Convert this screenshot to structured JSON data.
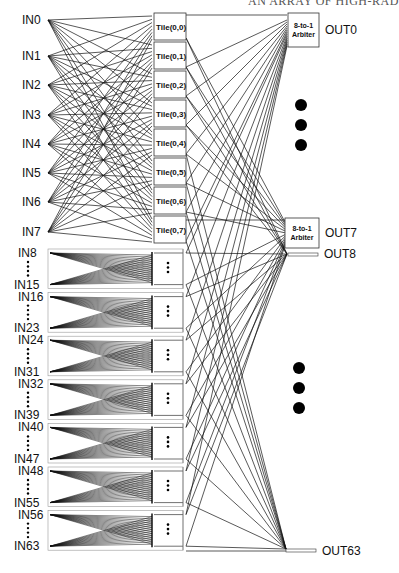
{
  "header": {
    "text": "AN ARRAY OF HIGH-RAD"
  },
  "inputs_top": [
    "IN0",
    "IN1",
    "IN2",
    "IN3",
    "IN4",
    "IN5",
    "IN6",
    "IN7"
  ],
  "tiles": [
    "Tile(0,0)",
    "Tile(0,1)",
    "Tile(0,2)",
    "Tile(0,3)",
    "Tile(0,4)",
    "Tile(0,5)",
    "Tile(0,6)",
    "Tile(0,7)"
  ],
  "input_groups": [
    {
      "first": "IN8",
      "last": "IN15"
    },
    {
      "first": "IN16",
      "last": "IN23"
    },
    {
      "first": "IN24",
      "last": "IN31"
    },
    {
      "first": "IN32",
      "last": "IN39"
    },
    {
      "first": "IN40",
      "last": "IN47"
    },
    {
      "first": "IN48",
      "last": "IN55"
    },
    {
      "first": "IN56",
      "last": "IN63"
    }
  ],
  "arbiters": [
    {
      "line1": "8-to-1",
      "line2": "Arbiter",
      "output": "OUT0"
    },
    {
      "line1": "8-to-1",
      "line2": "Arbiter",
      "output": "OUT7"
    }
  ],
  "outputs_plain": [
    "OUT8",
    "OUT63"
  ],
  "colors": {
    "line": "#111111",
    "box_border": "#333333",
    "group_border": "#999999",
    "background": "#ffffff"
  }
}
